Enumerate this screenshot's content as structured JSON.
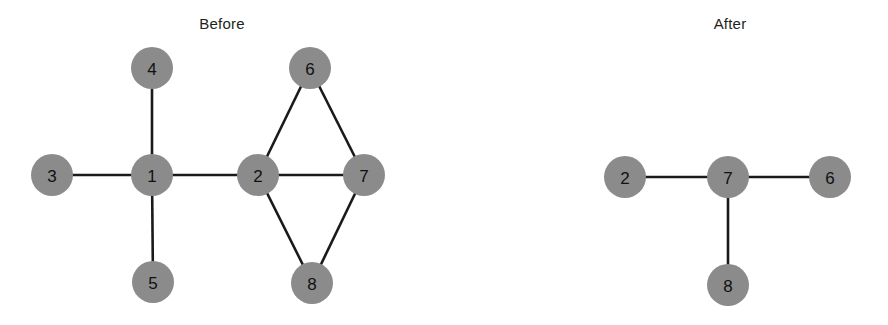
{
  "figure": {
    "width": 888,
    "height": 325,
    "background": "#ffffff",
    "node_fill": "#8b8b8b",
    "node_stroke": "none",
    "edge_color": "#1a1a1a",
    "edge_width": 2.6,
    "label_color": "#111111"
  },
  "panels": [
    {
      "id": "before",
      "title": "Before",
      "title_x": 222,
      "title_y": 23
    },
    {
      "id": "after",
      "title": "After",
      "title_x": 730,
      "title_y": 23
    }
  ],
  "chart_data": {
    "type": "diagram",
    "subtype": "node-link-graph",
    "title": "",
    "panels": [
      {
        "name": "Before",
        "nodes": [
          {
            "label": "1",
            "x": 152,
            "y": 175,
            "r": 21
          },
          {
            "label": "2",
            "x": 258,
            "y": 175,
            "r": 21
          },
          {
            "label": "3",
            "x": 52,
            "y": 175,
            "r": 21
          },
          {
            "label": "4",
            "x": 152,
            "y": 68,
            "r": 21
          },
          {
            "label": "5",
            "x": 153,
            "y": 282,
            "r": 21
          },
          {
            "label": "6",
            "x": 310,
            "y": 68,
            "r": 21
          },
          {
            "label": "7",
            "x": 364,
            "y": 175,
            "r": 21
          },
          {
            "label": "8",
            "x": 312,
            "y": 283,
            "r": 21
          }
        ],
        "edges": [
          [
            "3",
            "1"
          ],
          [
            "4",
            "1"
          ],
          [
            "5",
            "1"
          ],
          [
            "1",
            "2"
          ],
          [
            "2",
            "6"
          ],
          [
            "2",
            "7"
          ],
          [
            "2",
            "8"
          ],
          [
            "6",
            "7"
          ],
          [
            "7",
            "8"
          ]
        ]
      },
      {
        "name": "After",
        "nodes": [
          {
            "label": "2",
            "x": 625,
            "y": 177,
            "r": 21
          },
          {
            "label": "7",
            "x": 728,
            "y": 177,
            "r": 21
          },
          {
            "label": "6",
            "x": 830,
            "y": 177,
            "r": 21
          },
          {
            "label": "8",
            "x": 728,
            "y": 285,
            "r": 21
          }
        ],
        "edges": [
          [
            "2",
            "7"
          ],
          [
            "7",
            "6"
          ],
          [
            "7",
            "8"
          ]
        ]
      }
    ]
  }
}
